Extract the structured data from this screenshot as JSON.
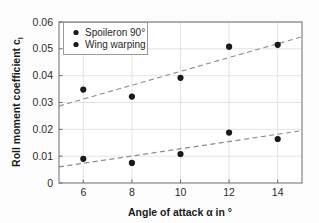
{
  "chart_data": {
    "type": "scatter",
    "title": "",
    "xlabel": "Angle of attack α in °",
    "ylabel": "Roll moment coefficient cₗ",
    "ylabel_main": "Roll moment coefficient c",
    "ylabel_sub": "l",
    "xlim": [
      5,
      15
    ],
    "ylim": [
      0,
      0.06
    ],
    "xticks": [
      6,
      8,
      10,
      12,
      14
    ],
    "xtick_labels": [
      "6",
      "8",
      "10",
      "12",
      "14"
    ],
    "yticks": [
      0,
      0.01,
      0.02,
      0.03,
      0.04,
      0.05,
      0.06
    ],
    "ytick_labels": [
      "0",
      "0.01",
      "0.02",
      "0.03",
      "0.04",
      "0.05",
      "0.06"
    ],
    "grid": true,
    "legend_position": "top-left",
    "x": [
      6,
      8,
      10,
      12,
      14
    ],
    "series": [
      {
        "name": "Spoileron 90°",
        "marker": "filled-circle",
        "color": "#1a1a1a",
        "values": [
          0.0348,
          0.0322,
          0.0392,
          0.0508,
          0.0515
        ],
        "trendline": {
          "style": "dashed",
          "x": [
            5,
            15
          ],
          "y": [
            0.0287,
            0.0545
          ]
        }
      },
      {
        "name": "Wing warping",
        "marker": "filled-circle",
        "color": "#1a1a1a",
        "values": [
          0.009,
          0.0075,
          0.0108,
          0.0188,
          0.0164
        ],
        "trendline": {
          "style": "dashed",
          "x": [
            5,
            15
          ],
          "y": [
            0.006,
            0.0195
          ]
        }
      }
    ]
  },
  "legend": {
    "entries": [
      {
        "label": "Spoileron 90°"
      },
      {
        "label": "Wing warping"
      }
    ]
  },
  "colors": {
    "marker": "#1a1a1a",
    "trendline": "#8c8c8c",
    "grid": "#dcdcdc",
    "axis": "#6b6b6b",
    "background": "#fdfdfd",
    "legend_border": "#9a9a9a",
    "legend_background": "#ffffff"
  }
}
